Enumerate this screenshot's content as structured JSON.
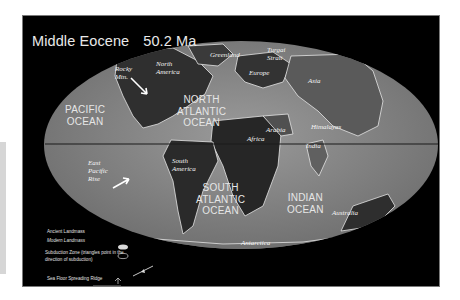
{
  "title": {
    "epoch": "Middle Eocene",
    "age": "50.2 Ma"
  },
  "colors": {
    "background": "#000000",
    "ocean": "#8a8a8a",
    "ancient_land": "#3a3a3a",
    "coastline": "#e8e8e8",
    "equator": "#1a1a1a"
  },
  "oceans": {
    "pacific": [
      "PACIFIC",
      "OCEAN"
    ],
    "north_atlantic": [
      "NORTH",
      "ATLANTIC",
      "OCEAN"
    ],
    "south_atlantic": [
      "SOUTH",
      "ATLANTIC",
      "OCEAN"
    ],
    "indian": [
      "INDIAN",
      "OCEAN"
    ]
  },
  "landmasses": {
    "rocky_mtn": [
      "Rocky",
      "Mtn."
    ],
    "north_america": [
      "North",
      "America"
    ],
    "greenland": "Greenland",
    "turgai_strait": [
      "Turgai",
      "Strait"
    ],
    "europe": "Europe",
    "asia": "Asia",
    "africa": "Africa",
    "arabia": "Arabia",
    "himalayas": "Himalayas",
    "india": "India",
    "south_america": [
      "South",
      "America"
    ],
    "east_pacific_rise": [
      "East",
      "Pacific",
      "Rise"
    ],
    "australia": "Australia",
    "antarctica": "Antarctica"
  },
  "legend": {
    "ancient_landmass": "Ancient Landmass",
    "modern_landmass": "Modern Landmass",
    "subduction_zone": [
      "Subduction Zone  (triangles point in the",
      "direction of subduction)"
    ],
    "sea_floor_spreading_ridge": "Sea Floor Spreading Ridge"
  }
}
